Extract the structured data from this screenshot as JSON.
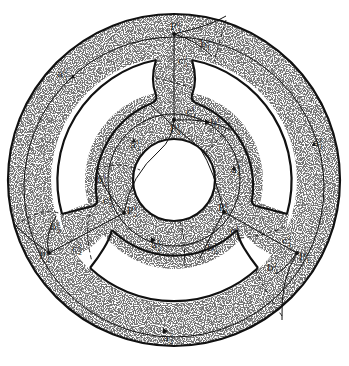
{
  "figure": {
    "colors": {
      "stroke": "#111111",
      "fill": "#ffffff",
      "stipple": "#222222"
    },
    "center": [
      174,
      180
    ],
    "regions": {
      "outer_ring": {
        "r_outer": 166,
        "r_inner": 123
      },
      "inner_ring": {
        "r_outer": 88,
        "r_inner": 41
      },
      "arms_angles_deg": [
        270,
        150,
        30
      ]
    },
    "points": [
      {
        "id": "P3_2",
        "base": "P",
        "sub": "3",
        "sup": "2",
        "x": 174,
        "y": 34
      },
      {
        "id": "P3_1",
        "base": "P",
        "sub": "3",
        "sup": "1",
        "x": 174,
        "y": 120
      },
      {
        "id": "P2_1",
        "base": "P",
        "sub": "2",
        "sup": "1",
        "x": 124,
        "y": 213
      },
      {
        "id": "P1_1",
        "base": "P",
        "sub": "1",
        "sup": "1",
        "x": 224,
        "y": 212
      },
      {
        "id": "P2_2",
        "base": "P",
        "sub": "2",
        "sup": "2",
        "x": 49,
        "y": 253
      },
      {
        "id": "P1_2",
        "base": "P",
        "sub": "1",
        "sup": "2",
        "x": 297,
        "y": 253
      }
    ],
    "labels": [
      {
        "id": "P3_2",
        "base": "P",
        "sub": "3",
        "sup": "2",
        "x": 170,
        "y": 30
      },
      {
        "id": "c3_2",
        "base": "c",
        "sub": "3",
        "sup": "2",
        "x": 178,
        "y": 64
      },
      {
        "id": "b1_2",
        "base": "b",
        "sub": "1",
        "sup": "2",
        "x": 200,
        "y": 47
      },
      {
        "id": "a3_2",
        "base": "a",
        "sub": "3",
        "sup": "2",
        "x": 57,
        "y": 77
      },
      {
        "id": "a1_2",
        "base": "a",
        "sub": "1",
        "sup": "2",
        "x": 313,
        "y": 146
      },
      {
        "id": "c3_1",
        "base": "c",
        "sub": "3",
        "sup": "1",
        "x": 186,
        "y": 115
      },
      {
        "id": "b1_1",
        "base": "b",
        "sub": "1",
        "sup": "1",
        "x": 210,
        "y": 126
      },
      {
        "id": "P3_1",
        "base": "P",
        "sub": "3",
        "sup": "1",
        "x": 170,
        "y": 132
      },
      {
        "id": "a3_1",
        "base": "a",
        "sub": "3",
        "sup": "1",
        "x": 130,
        "y": 148
      },
      {
        "id": "a1_1",
        "base": "a",
        "sub": "1",
        "sup": "1",
        "x": 231,
        "y": 173
      },
      {
        "id": "b3_1",
        "base": "b",
        "sub": "3",
        "sup": "1",
        "x": 96,
        "y": 183
      },
      {
        "id": "c2_1",
        "base": "c",
        "sub": "2",
        "sup": "1",
        "x": 103,
        "y": 204
      },
      {
        "id": "P2_1",
        "base": "P",
        "sub": "2",
        "sup": "1",
        "x": 127,
        "y": 214
      },
      {
        "id": "P1_1",
        "base": "P",
        "sub": "1",
        "sup": "1",
        "x": 218,
        "y": 211
      },
      {
        "id": "b3_2",
        "base": "b",
        "sub": "3",
        "sup": "2",
        "x": 50,
        "y": 230
      },
      {
        "id": "c2_2",
        "base": "c",
        "sub": "2",
        "sup": "2",
        "x": 72,
        "y": 252
      },
      {
        "id": "P2_2",
        "base": "P",
        "sub": "2",
        "sup": "2",
        "x": 39,
        "y": 259
      },
      {
        "id": "a2_1",
        "base": "a",
        "sub": "2",
        "sup": "1",
        "x": 151,
        "y": 248
      },
      {
        "id": "c1_1",
        "base": "c",
        "sub": "1",
        "sup": "1",
        "x": 230,
        "y": 234
      },
      {
        "id": "b2_1",
        "base": "b",
        "sub": "2",
        "sup": "1",
        "x": 207,
        "y": 251
      },
      {
        "id": "c1_2",
        "base": "c",
        "sub": "1",
        "sup": "2",
        "x": 282,
        "y": 244
      },
      {
        "id": "b2_2",
        "base": "b",
        "sub": "2",
        "sup": "2",
        "x": 267,
        "y": 271
      },
      {
        "id": "P1_2",
        "base": "P",
        "sub": "1",
        "sup": "2",
        "x": 299,
        "y": 260
      },
      {
        "id": "a2_2",
        "base": "a",
        "sub": "2",
        "sup": "2",
        "x": 163,
        "y": 341
      }
    ]
  }
}
